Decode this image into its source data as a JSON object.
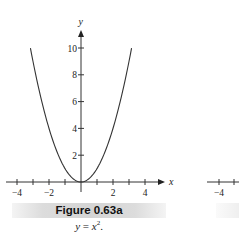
{
  "figure": {
    "label": "Figure 0.63a",
    "caption_lhs": "y",
    "caption_eq": " = ",
    "caption_rhs": "x",
    "caption_exp": "2",
    "caption_end": "."
  },
  "partial_right_figure": {
    "tick_label": "−4"
  },
  "chart_data": {
    "type": "line",
    "title": "Figure 0.63a",
    "subtitle": "y = x^2.",
    "xlabel": "x",
    "ylabel": "y",
    "xlim": [
      -4.6,
      5.2
    ],
    "ylim": [
      -0.7,
      11.5
    ],
    "x_ticks": [
      -4,
      -3,
      -2,
      -1,
      1,
      2,
      3,
      4
    ],
    "x_tick_labels": [
      "−4",
      "−2",
      "2",
      "4"
    ],
    "y_ticks": [
      2,
      4,
      6,
      8,
      10
    ],
    "y_tick_labels": [
      "2",
      "4",
      "6",
      "8",
      "10"
    ],
    "grid": false,
    "legend": null,
    "series": [
      {
        "name": "y = x^2",
        "function": "x^2",
        "x": [
          -3.16,
          -3,
          -2.5,
          -2,
          -1.5,
          -1,
          -0.5,
          0,
          0.5,
          1,
          1.5,
          2,
          2.5,
          3,
          3.16
        ],
        "y": [
          10,
          9,
          6.25,
          4,
          2.25,
          1,
          0.25,
          0,
          0.25,
          1,
          2.25,
          4,
          6.25,
          9,
          10
        ]
      }
    ]
  }
}
